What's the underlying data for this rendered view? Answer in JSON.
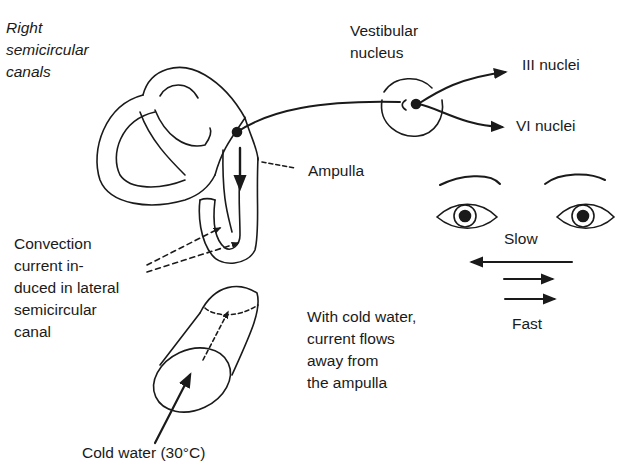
{
  "diagram": {
    "labels": {
      "right_canals": "Right\nsemicircular\ncanals",
      "vestibular_nucleus": "Vestibular\nnucleus",
      "iii_nuclei": "III nuclei",
      "vi_nuclei": "VI nuclei",
      "ampulla": "Ampulla",
      "convection": "Convection\ncurrent in-\nduced in lateral\nsemicircular\ncanal",
      "slow": "Slow",
      "fast": "Fast",
      "cold_water_note": "With cold water,\ncurrent flows\naway from\nthe ampulla",
      "cold_water": "Cold water (30°C)"
    },
    "colors": {
      "ink": "#1a1a1a",
      "background": "#ffffff"
    }
  }
}
